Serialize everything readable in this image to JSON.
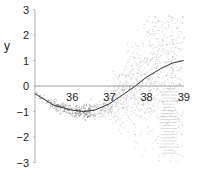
{
  "chart_data": {
    "type": "scatter",
    "title": "",
    "xlabel": "",
    "ylabel": "y",
    "xlim": [
      35,
      39
    ],
    "ylim": [
      -3,
      3
    ],
    "x_ticks": [
      36,
      37,
      38,
      39
    ],
    "y_ticks": [
      3,
      2,
      1,
      0,
      -1,
      -2,
      -3
    ],
    "grid": false,
    "legend": null,
    "reference_line": {
      "y": 0,
      "from_x": 35,
      "to_x": 39
    },
    "series": [
      {
        "name": "fitted curve",
        "kind": "line",
        "color": "#333333",
        "x": [
          35.0,
          35.5,
          36.0,
          36.3,
          36.6,
          37.0,
          37.4,
          37.7,
          38.0,
          38.4,
          38.7,
          39.0
        ],
        "y": [
          -0.3,
          -0.75,
          -0.95,
          -1.0,
          -0.95,
          -0.7,
          -0.3,
          0.0,
          0.35,
          0.7,
          0.9,
          1.0
        ]
      },
      {
        "name": "observations",
        "kind": "scatter",
        "color": "#888888",
        "description": "dense point cloud tightly around curve near x=35-36.5, spreading widely for x>37, spanning roughly y -3 to 2.5 near x=38-39"
      }
    ]
  },
  "axes": {
    "ylabel": "y",
    "y_tick_labels": [
      "3",
      "2",
      "1",
      "0",
      "−1",
      "−2",
      "−3"
    ],
    "x_tick_labels": [
      "36",
      "37",
      "38",
      "39"
    ]
  }
}
